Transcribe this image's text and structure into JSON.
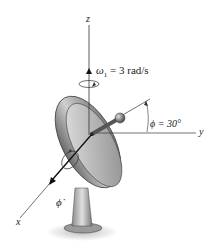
{
  "figure": {
    "axes": {
      "x": "x",
      "y": "y",
      "z": "z"
    },
    "omega_label": {
      "symbol": "ω",
      "subscript": "1",
      "value": "= 3 rad/s"
    },
    "phi_angle_label": "ϕ = 30°",
    "phi_dot_label": "ϕ̇",
    "colors": {
      "dish_dark": "#555555",
      "dish_light": "#d8d8d8",
      "axis_line": "#333333",
      "background": "#ffffff"
    }
  }
}
